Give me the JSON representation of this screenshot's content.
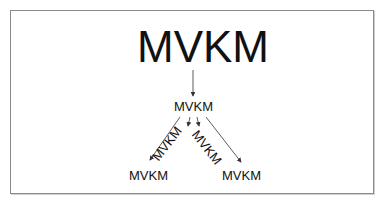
{
  "diagram": {
    "root": {
      "label": "MVKM"
    },
    "middle": {
      "label": "MVKM"
    },
    "bottom_left": {
      "label": "MVKM"
    },
    "rotated_left": {
      "label": "MVKM"
    },
    "rotated_right": {
      "label": "MVKM"
    },
    "bottom_right": {
      "label": "MVKM"
    },
    "colors": {
      "text": "#111111",
      "border": "#8a8a8a",
      "arrow": "#333333",
      "background": "#ffffff"
    }
  }
}
